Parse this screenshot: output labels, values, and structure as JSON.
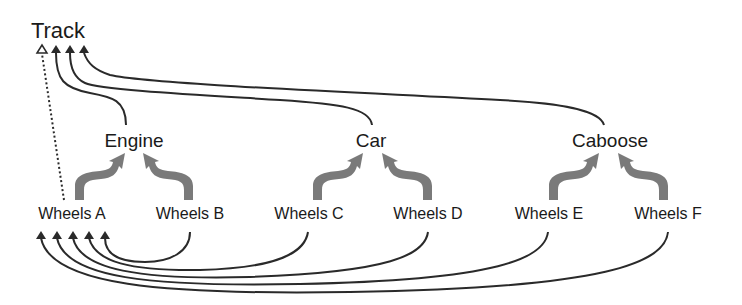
{
  "diagram": {
    "colors": {
      "line": "#2a2a2a",
      "fat_arrow": "#7a7a7a",
      "background": "#ffffff"
    },
    "root": {
      "id": "track",
      "label": "Track"
    },
    "mid_nodes": [
      {
        "id": "engine",
        "label": "Engine"
      },
      {
        "id": "car",
        "label": "Car"
      },
      {
        "id": "caboose",
        "label": "Caboose"
      }
    ],
    "leaf_nodes": [
      {
        "id": "wheels_a",
        "label": "Wheels A"
      },
      {
        "id": "wheels_b",
        "label": "Wheels B"
      },
      {
        "id": "wheels_c",
        "label": "Wheels C"
      },
      {
        "id": "wheels_d",
        "label": "Wheels D"
      },
      {
        "id": "wheels_e",
        "label": "Wheels E"
      },
      {
        "id": "wheels_f",
        "label": "Wheels F"
      }
    ],
    "edges": {
      "composition": [
        {
          "from": "Wheels A",
          "to": "Engine"
        },
        {
          "from": "Wheels B",
          "to": "Engine"
        },
        {
          "from": "Wheels C",
          "to": "Car"
        },
        {
          "from": "Wheels D",
          "to": "Car"
        },
        {
          "from": "Wheels E",
          "to": "Caboose"
        },
        {
          "from": "Wheels F",
          "to": "Caboose"
        }
      ],
      "to_track": [
        {
          "from": "Engine",
          "to": "Track",
          "style": "solid"
        },
        {
          "from": "Car",
          "to": "Track",
          "style": "solid"
        },
        {
          "from": "Caboose",
          "to": "Track",
          "style": "solid"
        },
        {
          "from": "Wheels A",
          "to": "Track",
          "style": "dotted",
          "head": "hollow"
        }
      ],
      "to_wheels_a": [
        {
          "from": "Wheels B",
          "to": "Wheels A"
        },
        {
          "from": "Wheels C",
          "to": "Wheels A"
        },
        {
          "from": "Wheels D",
          "to": "Wheels A"
        },
        {
          "from": "Wheels E",
          "to": "Wheels A"
        },
        {
          "from": "Wheels F",
          "to": "Wheels A"
        }
      ]
    }
  }
}
